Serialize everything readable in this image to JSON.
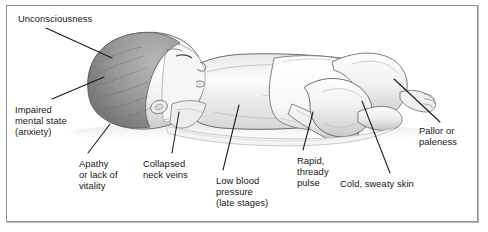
{
  "figure": {
    "frame_color": "#8e8e8e",
    "background_color": "#ffffff",
    "line_color": "#1a1a1a",
    "text_color": "#18181a"
  },
  "labels": [
    {
      "id": "unconsciousness",
      "text": "Unconsciousness",
      "x": 18,
      "y": 13,
      "align": "left"
    },
    {
      "id": "impaired-mental-state",
      "text": "Impaired\nmental state\n(anxiety)",
      "x": 15,
      "y": 104,
      "align": "left"
    },
    {
      "id": "apathy-or-lack-of-vitality",
      "text": "Apathy\nor lack of\nvitality",
      "x": 79,
      "y": 158,
      "align": "left"
    },
    {
      "id": "collapsed-neck-veins",
      "text": "Collapsed\nneck veins",
      "x": 143,
      "y": 158,
      "align": "left"
    },
    {
      "id": "low-blood-pressure",
      "text": "Low blood\npressure\n(late stages)",
      "x": 216,
      "y": 175,
      "align": "left"
    },
    {
      "id": "rapid-thready-pulse",
      "text": "Rapid,\nthready\npulse",
      "x": 297,
      "y": 155,
      "align": "left"
    },
    {
      "id": "cold-sweaty-skin",
      "text": "Cold, sweaty skin",
      "x": 340,
      "y": 178,
      "align": "left"
    },
    {
      "id": "pallor-or-paleness",
      "text": "Pallor or\npaleness",
      "x": 419,
      "y": 125,
      "align": "left"
    }
  ],
  "leader_lines": [
    {
      "id": "line-unconsciousness",
      "x1": 46,
      "y1": 28,
      "x2": 112,
      "y2": 58
    },
    {
      "id": "line-impaired-mental-state",
      "x1": 52,
      "y1": 99,
      "x2": 104,
      "y2": 77
    },
    {
      "id": "line-apathy",
      "x1": 88,
      "y1": 153,
      "x2": 110,
      "y2": 124
    },
    {
      "id": "line-collapsed-neck-veins",
      "x1": 172,
      "y1": 153,
      "x2": 179,
      "y2": 112
    },
    {
      "id": "line-low-blood-pressure",
      "x1": 223,
      "y1": 170,
      "x2": 239,
      "y2": 105
    },
    {
      "id": "line-rapid-thready-pulse",
      "x1": 303,
      "y1": 150,
      "x2": 313,
      "y2": 112
    },
    {
      "id": "line-cold-sweaty-skin",
      "x1": 390,
      "y1": 173,
      "x2": 362,
      "y2": 101
    },
    {
      "id": "line-pallor-or-paleness",
      "x1": 440,
      "y1": 122,
      "x2": 394,
      "y2": 79
    }
  ]
}
